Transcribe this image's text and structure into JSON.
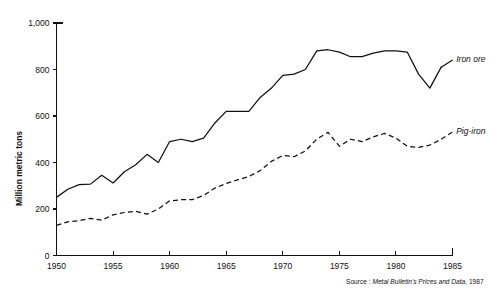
{
  "chart_data": {
    "type": "line",
    "title": "",
    "xlabel": "",
    "ylabel": "Million metric tons",
    "xlim": [
      1950,
      1985
    ],
    "ylim": [
      0,
      1000
    ],
    "grid": false,
    "legend_position": "right-inline",
    "x_ticks": [
      "1950",
      "1955",
      "1960",
      "1965",
      "1970",
      "1975",
      "1980",
      "1985"
    ],
    "x_tick_values": [
      1950,
      1955,
      1960,
      1965,
      1970,
      1975,
      1980,
      1985
    ],
    "y_ticks": [
      "0",
      "200",
      "400",
      "600",
      "800",
      "1,000"
    ],
    "y_tick_values": [
      0,
      200,
      400,
      600,
      800,
      1000
    ],
    "x": [
      1950,
      1951,
      1952,
      1953,
      1954,
      1955,
      1956,
      1957,
      1958,
      1959,
      1960,
      1961,
      1962,
      1963,
      1964,
      1965,
      1966,
      1967,
      1968,
      1969,
      1970,
      1971,
      1972,
      1973,
      1974,
      1975,
      1976,
      1977,
      1978,
      1979,
      1980,
      1981,
      1982,
      1983,
      1984
    ],
    "series": [
      {
        "name": "Iron ore",
        "style": "solid",
        "label": "Iron ore",
        "values": [
          250,
          285,
          305,
          307,
          345,
          312,
          360,
          390,
          435,
          400,
          490,
          500,
          490,
          505,
          570,
          620,
          620,
          620,
          680,
          720,
          775,
          780,
          800,
          880,
          885,
          875,
          855,
          855,
          870,
          880,
          880,
          875,
          780,
          720,
          810
        ]
      },
      {
        "name": "Pig-iron",
        "style": "dashed",
        "label": "Pig-iron",
        "values": [
          130,
          145,
          150,
          160,
          152,
          175,
          185,
          190,
          178,
          200,
          235,
          240,
          240,
          258,
          290,
          310,
          325,
          340,
          365,
          405,
          430,
          425,
          450,
          500,
          530,
          470,
          500,
          490,
          510,
          525,
          505,
          470,
          465,
          475,
          500
        ]
      }
    ],
    "source": {
      "prefix": "Source : ",
      "italic": "Metal Bulletin's Prices and Data",
      "suffix": ", 1987"
    }
  }
}
